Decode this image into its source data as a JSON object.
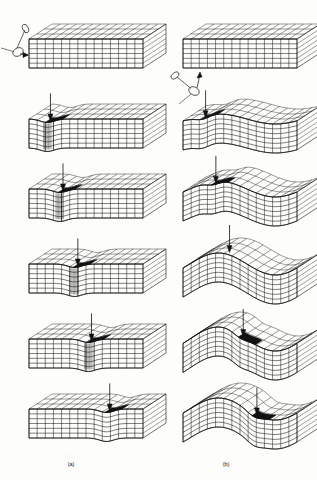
{
  "figure": {
    "background_color": "#fdfdfb",
    "ink_color": "#111111",
    "crater_fill_color": "#111111",
    "style": "line-art-finite-element-mesh",
    "columns": [
      {
        "id": "a",
        "caption": "(a)",
        "caption_x": 142,
        "deformation_mode": "localized penetration"
      },
      {
        "id": "b",
        "caption": "(b)",
        "caption_x": 452,
        "deformation_mode": "global bending wave"
      }
    ],
    "row_count": 6,
    "rows": [
      {
        "index": 1,
        "label": "initial configuration, impactor approaching"
      },
      {
        "index": 2,
        "label": "early impact"
      },
      {
        "index": 3,
        "label": "progressive deformation"
      },
      {
        "index": 4,
        "label": "intermediate deformation"
      },
      {
        "index": 5,
        "label": "advanced deformation"
      },
      {
        "index": 6,
        "label": "final configuration"
      }
    ],
    "mesh": {
      "front_columns": 14,
      "front_rows": 6,
      "top_columns": 14,
      "top_rows": 3
    },
    "impactor": {
      "shape": "rod with rounded head",
      "a_direction": "from upper-left, horizontal strike on left end face",
      "b_direction": "from lower-left, strike on lower-left edge"
    },
    "arrow": {
      "shape": "vertical line with solid triangular head",
      "orientation": "downward"
    },
    "panels_a": [
      {
        "row": 1,
        "has_impactor": true,
        "has_arrow": false,
        "crater": false,
        "wave_amplitude": 0,
        "crush_band": false,
        "impact_x": 0.08
      },
      {
        "row": 2,
        "has_impactor": false,
        "has_arrow": true,
        "crater": true,
        "wave_amplitude": 0,
        "crush_band": true,
        "impact_x": 0.16
      },
      {
        "row": 3,
        "has_impactor": false,
        "has_arrow": true,
        "crater": true,
        "wave_amplitude": 0,
        "crush_band": true,
        "impact_x": 0.27
      },
      {
        "row": 4,
        "has_impactor": false,
        "has_arrow": true,
        "crater": true,
        "wave_amplitude": 0,
        "crush_band": true,
        "impact_x": 0.4
      },
      {
        "row": 5,
        "has_impactor": false,
        "has_arrow": true,
        "crater": true,
        "wave_amplitude": 0,
        "crush_band": true,
        "impact_x": 0.52
      },
      {
        "row": 6,
        "has_impactor": false,
        "has_arrow": true,
        "crater": true,
        "wave_amplitude": 0,
        "crush_band": false,
        "impact_x": 0.68
      }
    ],
    "panels_b": [
      {
        "row": 1,
        "has_impactor": true,
        "has_arrow": false,
        "crater": false,
        "wave_amplitude": 0,
        "crush_band": false,
        "impact_x": 0.1
      },
      {
        "row": 2,
        "has_impactor": false,
        "has_arrow": true,
        "crater": true,
        "wave_amplitude": 10,
        "crush_band": false,
        "impact_x": 0.17
      },
      {
        "row": 3,
        "has_impactor": false,
        "has_arrow": true,
        "crater": true,
        "wave_amplitude": 16,
        "crush_band": false,
        "impact_x": 0.26
      },
      {
        "row": 4,
        "has_impactor": false,
        "has_arrow": true,
        "crater": false,
        "wave_amplitude": 22,
        "crush_band": false,
        "impact_x": 0.38
      },
      {
        "row": 5,
        "has_impactor": false,
        "has_arrow": true,
        "crater": true,
        "wave_amplitude": 24,
        "crush_band": false,
        "impact_x": 0.5
      },
      {
        "row": 6,
        "has_impactor": false,
        "has_arrow": true,
        "crater": true,
        "wave_amplitude": 22,
        "crush_band": false,
        "impact_x": 0.62
      }
    ]
  }
}
